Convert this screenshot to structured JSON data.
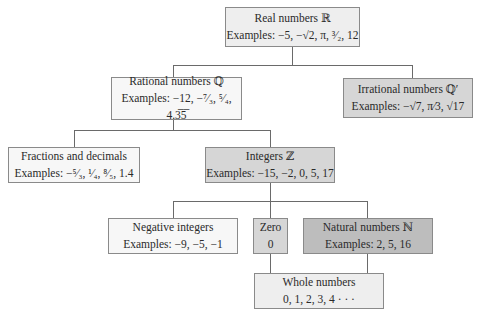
{
  "diagram": {
    "nodes": {
      "real": {
        "title": "Real numbers ℝ",
        "examples": "Examples: −5, −√2, π, ³⁄₂, 12"
      },
      "rational": {
        "title": "Rational numbers ℚ",
        "examples": "Examples: −12, −⁷⁄₃, ⁵⁄₄, 4.3̅5̅"
      },
      "irrational": {
        "title": "Irrational numbers ℚ′",
        "examples": "Examples: −√7, π⁄3, √17"
      },
      "fractions": {
        "title": "Fractions and decimals",
        "examples": "Examples: −⁵⁄₃, ¹⁄₄, ⁸⁄₅, 1.4"
      },
      "integers": {
        "title": "Integers ℤ",
        "examples": "Examples: −15, −2, 0, 5, 17"
      },
      "negative": {
        "title": "Negative integers",
        "examples": "Examples: −9, −5, −1"
      },
      "zero": {
        "title": "Zero",
        "examples": "0"
      },
      "natural": {
        "title": "Natural numbers ℕ",
        "examples": "Examples: 2, 5, 16"
      },
      "whole": {
        "title": "Whole numbers",
        "examples": "0, 1, 2, 3, 4 · · ·"
      }
    },
    "edges": [
      [
        "real",
        "rational"
      ],
      [
        "real",
        "irrational"
      ],
      [
        "rational",
        "fractions"
      ],
      [
        "rational",
        "integers"
      ],
      [
        "integers",
        "negative"
      ],
      [
        "integers",
        "zero"
      ],
      [
        "integers",
        "natural"
      ],
      [
        "zero",
        "whole"
      ],
      [
        "natural",
        "whole"
      ]
    ],
    "colors": {
      "border": "#8a8a8a",
      "line": "#6a6a6a",
      "fill_light": "#eeeeee",
      "fill_white": "#f7f7f7",
      "fill_mid": "#d6d6d6",
      "fill_dark": "#bdbdbd"
    }
  }
}
